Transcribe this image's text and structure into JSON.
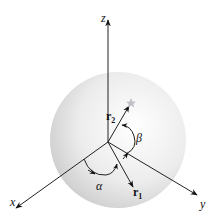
{
  "diagram": {
    "axes": {
      "z": {
        "label": "z"
      },
      "x": {
        "label": "x"
      },
      "y": {
        "label": "y"
      }
    },
    "vectors": {
      "r1": {
        "label": "r",
        "sub": "1"
      },
      "r2": {
        "label": "r",
        "sub": "2"
      }
    },
    "angles": {
      "alpha": {
        "label": "α"
      },
      "beta": {
        "label": "β"
      }
    },
    "colors": {
      "axis": "#222222",
      "sphere_light": "#ffffff",
      "sphere_dark": "#c8c8c8",
      "star": "#c0c0c8"
    }
  }
}
